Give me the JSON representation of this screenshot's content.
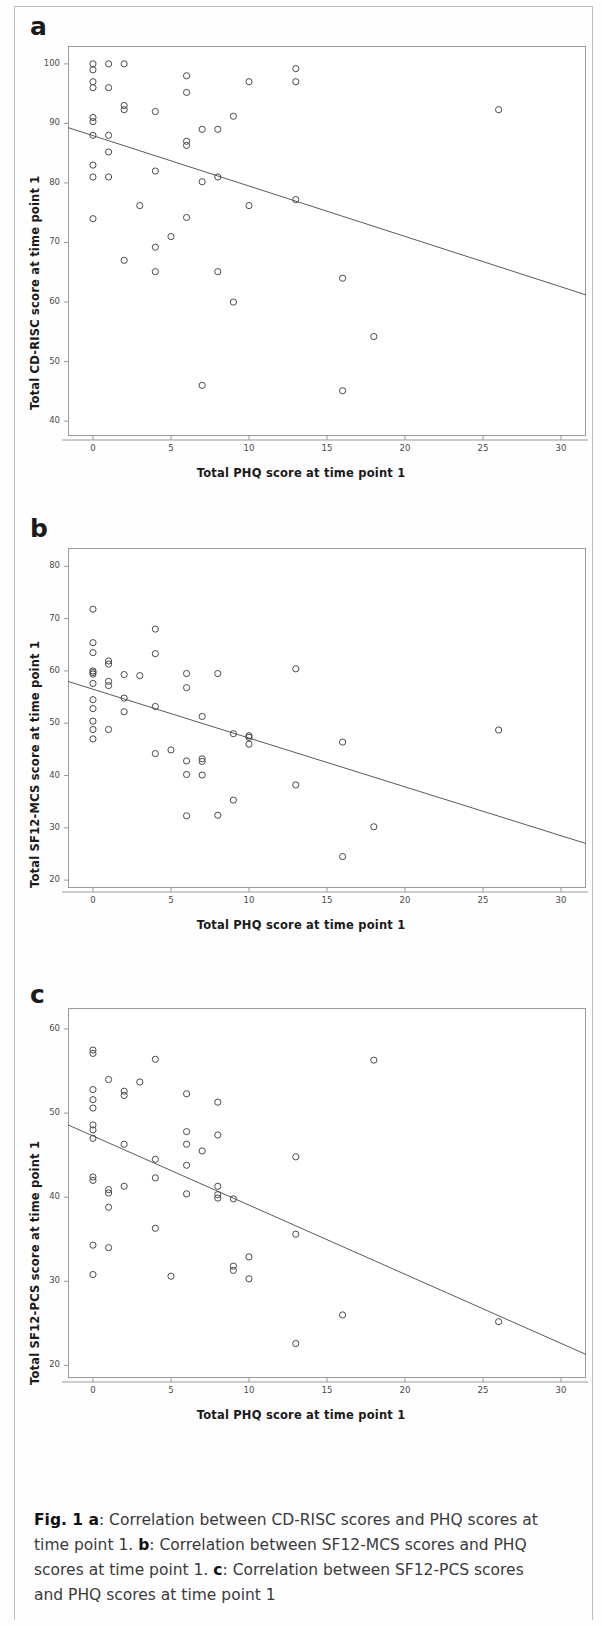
{
  "figure": {
    "label": "Fig. 1",
    "caption_segments": [
      {
        "text": "Fig. 1 ",
        "bold": true
      },
      {
        "text": "a",
        "bold": true
      },
      {
        "text": ": Correlation between CD-RISC scores and PHQ scores at time point 1. ",
        "bold": false
      },
      {
        "text": "b",
        "bold": true
      },
      {
        "text": ": Correlation between SF12-MCS scores and PHQ scores at time point 1. ",
        "bold": false
      },
      {
        "text": "c",
        "bold": true
      },
      {
        "text": ": Correlation between SF12-PCS scores and PHQ scores at time point 1",
        "bold": false
      }
    ],
    "caption_plain": "Fig. 1 a: Correlation between CD-RISC scores and PHQ scores at time point 1. b: Correlation between SF12-MCS scores and PHQ scores at time point 1. c: Correlation between SF12-PCS scores and PHQ scores at time point 1"
  },
  "style": {
    "marker_stroke": "#4a4a4a",
    "marker_fill": "none",
    "marker_radius": 3.1,
    "line_color": "#5a5a5a",
    "frame_color": "#9a9a9a",
    "text_color": "#1a1a1a"
  },
  "chart_data": [
    {
      "id": "a",
      "panel_letter": "a",
      "type": "scatter",
      "title": "",
      "xlabel": "Total PHQ score at time point 1",
      "ylabel": "Total CD-RISC score at time point 1",
      "xlim": [
        -1.6,
        31.6
      ],
      "ylim": [
        37.5,
        103.0
      ],
      "xticks": [
        0,
        5,
        10,
        15,
        20,
        25,
        30
      ],
      "yticks": [
        40,
        50,
        60,
        70,
        80,
        90,
        100
      ],
      "grid": false,
      "legend": "none",
      "trendline": {
        "x": [
          -1.6,
          31.6
        ],
        "y": [
          89.3,
          61.2
        ],
        "label": "linear fit"
      },
      "points": [
        {
          "x": 0,
          "y": 100.0
        },
        {
          "x": 0,
          "y": 99.0
        },
        {
          "x": 1,
          "y": 100.0
        },
        {
          "x": 2,
          "y": 100.0
        },
        {
          "x": 0,
          "y": 97.0
        },
        {
          "x": 0,
          "y": 96.0
        },
        {
          "x": 1,
          "y": 96.0
        },
        {
          "x": 6,
          "y": 98.0
        },
        {
          "x": 6,
          "y": 95.2
        },
        {
          "x": 13,
          "y": 99.2
        },
        {
          "x": 10,
          "y": 97.0
        },
        {
          "x": 13,
          "y": 97.0
        },
        {
          "x": 2,
          "y": 93.0
        },
        {
          "x": 2,
          "y": 92.3
        },
        {
          "x": 4,
          "y": 92.0
        },
        {
          "x": 26,
          "y": 92.3
        },
        {
          "x": 0,
          "y": 91.0
        },
        {
          "x": 0,
          "y": 90.3
        },
        {
          "x": 9,
          "y": 91.2
        },
        {
          "x": 0,
          "y": 88.0
        },
        {
          "x": 1,
          "y": 88.0
        },
        {
          "x": 7,
          "y": 89.0
        },
        {
          "x": 8,
          "y": 89.0
        },
        {
          "x": 1,
          "y": 85.2
        },
        {
          "x": 6,
          "y": 87.0
        },
        {
          "x": 6,
          "y": 86.3
        },
        {
          "x": 0,
          "y": 83.0
        },
        {
          "x": 4,
          "y": 82.0
        },
        {
          "x": 0,
          "y": 81.0
        },
        {
          "x": 1,
          "y": 81.0
        },
        {
          "x": 7,
          "y": 80.2
        },
        {
          "x": 8,
          "y": 81.0
        },
        {
          "x": 3,
          "y": 76.2
        },
        {
          "x": 10,
          "y": 76.2
        },
        {
          "x": 13,
          "y": 77.2
        },
        {
          "x": 0,
          "y": 74.0
        },
        {
          "x": 6,
          "y": 74.2
        },
        {
          "x": 5,
          "y": 71.0
        },
        {
          "x": 4,
          "y": 69.2
        },
        {
          "x": 2,
          "y": 67.0
        },
        {
          "x": 4,
          "y": 65.1
        },
        {
          "x": 8,
          "y": 65.1
        },
        {
          "x": 16,
          "y": 64.0
        },
        {
          "x": 9,
          "y": 60.0
        },
        {
          "x": 18,
          "y": 54.2
        },
        {
          "x": 7,
          "y": 46.0
        },
        {
          "x": 16,
          "y": 45.1
        }
      ]
    },
    {
      "id": "b",
      "panel_letter": "b",
      "type": "scatter",
      "title": "",
      "xlabel": "Total PHQ score at time point 1",
      "ylabel": "Total SF12-MCS score at time point 1",
      "xlim": [
        -1.6,
        31.6
      ],
      "ylim": [
        18.5,
        83.5
      ],
      "xticks": [
        0,
        5,
        10,
        15,
        20,
        25,
        30
      ],
      "yticks": [
        20,
        30,
        40,
        50,
        60,
        70,
        80
      ],
      "grid": false,
      "legend": "none",
      "trendline": {
        "x": [
          -1.6,
          31.6
        ],
        "y": [
          58.0,
          27.0
        ],
        "label": "linear fit"
      },
      "points": [
        {
          "x": 0,
          "y": 71.8
        },
        {
          "x": 4,
          "y": 68.0
        },
        {
          "x": 4,
          "y": 63.3
        },
        {
          "x": 0,
          "y": 65.4
        },
        {
          "x": 0,
          "y": 63.5
        },
        {
          "x": 1,
          "y": 61.9
        },
        {
          "x": 1,
          "y": 61.3
        },
        {
          "x": 0,
          "y": 60.0
        },
        {
          "x": 0,
          "y": 59.7
        },
        {
          "x": 0,
          "y": 59.4
        },
        {
          "x": 2,
          "y": 59.3
        },
        {
          "x": 3,
          "y": 59.1
        },
        {
          "x": 6,
          "y": 59.5
        },
        {
          "x": 8,
          "y": 59.5
        },
        {
          "x": 13,
          "y": 60.4
        },
        {
          "x": 0,
          "y": 57.6
        },
        {
          "x": 1,
          "y": 58.0
        },
        {
          "x": 1,
          "y": 57.2
        },
        {
          "x": 6,
          "y": 56.8
        },
        {
          "x": 0,
          "y": 54.5
        },
        {
          "x": 2,
          "y": 54.8
        },
        {
          "x": 0,
          "y": 52.8
        },
        {
          "x": 2,
          "y": 52.2
        },
        {
          "x": 4,
          "y": 53.2
        },
        {
          "x": 0,
          "y": 50.4
        },
        {
          "x": 7,
          "y": 51.3
        },
        {
          "x": 0,
          "y": 48.8
        },
        {
          "x": 1,
          "y": 48.8
        },
        {
          "x": 0,
          "y": 47.0
        },
        {
          "x": 9,
          "y": 48.0
        },
        {
          "x": 10,
          "y": 47.6
        },
        {
          "x": 10,
          "y": 47.3
        },
        {
          "x": 16,
          "y": 46.4
        },
        {
          "x": 26,
          "y": 48.7
        },
        {
          "x": 10,
          "y": 46.0
        },
        {
          "x": 5,
          "y": 44.9
        },
        {
          "x": 4,
          "y": 44.2
        },
        {
          "x": 6,
          "y": 42.8
        },
        {
          "x": 7,
          "y": 43.2
        },
        {
          "x": 7,
          "y": 42.7
        },
        {
          "x": 6,
          "y": 40.2
        },
        {
          "x": 7,
          "y": 40.1
        },
        {
          "x": 13,
          "y": 38.2
        },
        {
          "x": 9,
          "y": 35.3
        },
        {
          "x": 6,
          "y": 32.3
        },
        {
          "x": 8,
          "y": 32.4
        },
        {
          "x": 18,
          "y": 30.2
        },
        {
          "x": 16,
          "y": 24.5
        }
      ]
    },
    {
      "id": "c",
      "panel_letter": "c",
      "type": "scatter",
      "title": "",
      "xlabel": "Total PHQ score at time point 1",
      "ylabel": "Total SF12-PCS score at time point 1",
      "xlim": [
        -1.6,
        31.6
      ],
      "ylim": [
        18.5,
        62.5
      ],
      "xticks": [
        0,
        5,
        10,
        15,
        20,
        25,
        30
      ],
      "yticks": [
        20,
        30,
        40,
        50,
        60
      ],
      "grid": false,
      "legend": "none",
      "trendline": {
        "x": [
          -1.6,
          31.6
        ],
        "y": [
          48.6,
          21.3
        ],
        "label": "linear fit"
      },
      "points": [
        {
          "x": 0,
          "y": 57.5
        },
        {
          "x": 0,
          "y": 57.1
        },
        {
          "x": 4,
          "y": 56.4
        },
        {
          "x": 18,
          "y": 56.3
        },
        {
          "x": 1,
          "y": 54.0
        },
        {
          "x": 3,
          "y": 53.7
        },
        {
          "x": 0,
          "y": 52.8
        },
        {
          "x": 2,
          "y": 52.6
        },
        {
          "x": 2,
          "y": 52.1
        },
        {
          "x": 6,
          "y": 52.3
        },
        {
          "x": 0,
          "y": 51.6
        },
        {
          "x": 8,
          "y": 51.3
        },
        {
          "x": 0,
          "y": 50.6
        },
        {
          "x": 0,
          "y": 48.6
        },
        {
          "x": 0,
          "y": 48.0
        },
        {
          "x": 6,
          "y": 47.8
        },
        {
          "x": 8,
          "y": 47.4
        },
        {
          "x": 0,
          "y": 47.0
        },
        {
          "x": 2,
          "y": 46.3
        },
        {
          "x": 6,
          "y": 46.3
        },
        {
          "x": 7,
          "y": 45.5
        },
        {
          "x": 13,
          "y": 44.8
        },
        {
          "x": 4,
          "y": 44.5
        },
        {
          "x": 6,
          "y": 43.8
        },
        {
          "x": 0,
          "y": 42.4
        },
        {
          "x": 0,
          "y": 42.0
        },
        {
          "x": 4,
          "y": 42.3
        },
        {
          "x": 8,
          "y": 41.3
        },
        {
          "x": 2,
          "y": 41.3
        },
        {
          "x": 1,
          "y": 40.9
        },
        {
          "x": 1,
          "y": 40.5
        },
        {
          "x": 6,
          "y": 40.4
        },
        {
          "x": 8,
          "y": 40.3
        },
        {
          "x": 8,
          "y": 39.9
        },
        {
          "x": 9,
          "y": 39.8
        },
        {
          "x": 1,
          "y": 38.8
        },
        {
          "x": 4,
          "y": 36.3
        },
        {
          "x": 13,
          "y": 35.6
        },
        {
          "x": 0,
          "y": 34.3
        },
        {
          "x": 1,
          "y": 34.0
        },
        {
          "x": 10,
          "y": 32.9
        },
        {
          "x": 9,
          "y": 31.8
        },
        {
          "x": 9,
          "y": 31.3
        },
        {
          "x": 0,
          "y": 30.8
        },
        {
          "x": 5,
          "y": 30.6
        },
        {
          "x": 10,
          "y": 30.3
        },
        {
          "x": 16,
          "y": 26.0
        },
        {
          "x": 26,
          "y": 25.2
        },
        {
          "x": 13,
          "y": 22.6
        }
      ]
    }
  ]
}
